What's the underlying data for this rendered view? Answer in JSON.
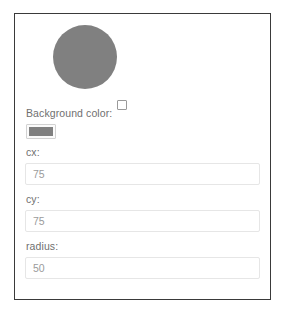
{
  "panel": {
    "preview": {
      "shape": "circle",
      "fill_color": "#808080",
      "cx": 75,
      "cy": 75,
      "radius": 50,
      "checkbox_checked": false,
      "checkbox_label": ""
    },
    "fields": {
      "background_color": {
        "label": "Background color:",
        "value": "#808080"
      },
      "cx": {
        "label": "cx:",
        "value": "75",
        "placeholder": "cx"
      },
      "cy": {
        "label": "cy:",
        "value": "75",
        "placeholder": "cy"
      },
      "radius": {
        "label": "radius:",
        "value": "50",
        "placeholder": "radius"
      }
    }
  },
  "colors": {
    "shape_fill": "#808080",
    "frame_border": "#3a3a3a",
    "input_border": "#e6e6e6",
    "label_text": "#6f6f6f",
    "value_text": "#9b9b9b",
    "background": "#ffffff"
  }
}
